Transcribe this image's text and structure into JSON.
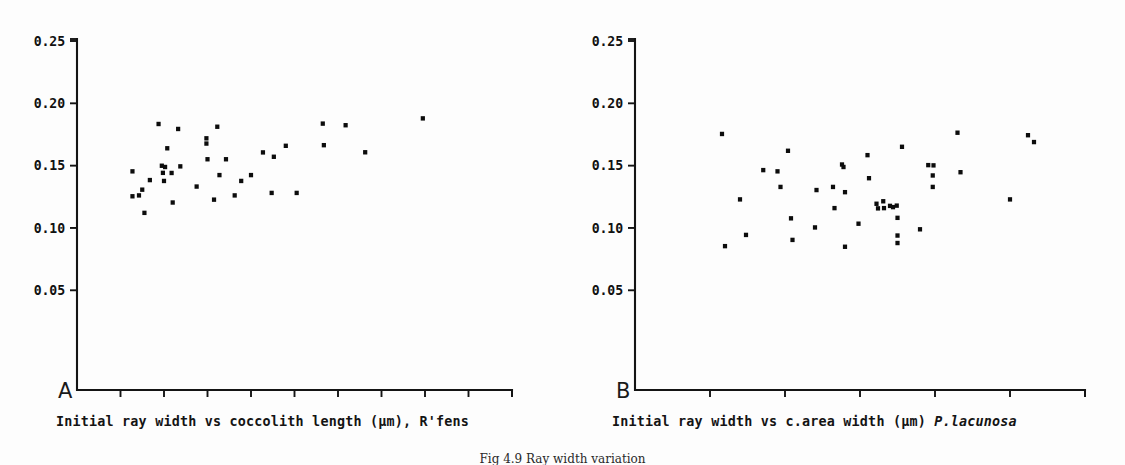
{
  "figure": {
    "caption": "Fig 4.9   Ray width variation",
    "background_color": "#fdfdfd",
    "ink_color": "#0c0c0c"
  },
  "panels": [
    {
      "id": "A",
      "letter": "A",
      "caption_prefix": "Initial ray width vs coccolith length (µm), R'fens",
      "caption_species": "",
      "species_italic": false
    },
    {
      "id": "B",
      "letter": "B",
      "caption_prefix": "Initial ray width vs c.area width (µm) ",
      "caption_species": "P.lacunosa",
      "species_italic": true
    }
  ],
  "chart_data": [
    {
      "type": "scatter",
      "panel": "A",
      "title": "",
      "xlabel": "Initial ray width vs coccolith length (µm), R'fens",
      "ylabel": "",
      "xlim": [
        0,
        20
      ],
      "ylim": [
        0,
        0.25
      ],
      "xticks": [
        2,
        4,
        6,
        8,
        10,
        12,
        14,
        16,
        18,
        20
      ],
      "xticklabels": [
        "2",
        "4",
        "6",
        "8",
        "10",
        "12",
        "14",
        "16",
        "18",
        "20"
      ],
      "yticks": [
        0.05,
        0.1,
        0.15,
        0.2,
        0.25
      ],
      "yticklabels": [
        "0.05",
        "0.10",
        "0.15",
        "0.20",
        "0.25"
      ],
      "grid": false,
      "legend": false,
      "marker": "square",
      "marker_color": "#0c0c0c",
      "points": [
        [
          2.55,
          0.1455
        ],
        [
          2.55,
          0.1255
        ],
        [
          2.85,
          0.1262
        ],
        [
          3.0,
          0.1308
        ],
        [
          3.1,
          0.1122
        ],
        [
          3.35,
          0.1385
        ],
        [
          3.75,
          0.1835
        ],
        [
          3.9,
          0.15
        ],
        [
          3.95,
          0.1443
        ],
        [
          4.05,
          0.149
        ],
        [
          4.0,
          0.1378
        ],
        [
          4.15,
          0.164
        ],
        [
          4.35,
          0.1442
        ],
        [
          4.4,
          0.1205
        ],
        [
          4.65,
          0.1795
        ],
        [
          4.75,
          0.1495
        ],
        [
          5.5,
          0.1333
        ],
        [
          5.95,
          0.172
        ],
        [
          5.95,
          0.1678
        ],
        [
          6.0,
          0.1552
        ],
        [
          6.3,
          0.1228
        ],
        [
          6.45,
          0.1813
        ],
        [
          6.55,
          0.1425
        ],
        [
          6.85,
          0.1552
        ],
        [
          7.25,
          0.1262
        ],
        [
          7.55,
          0.1378
        ],
        [
          8.0,
          0.1425
        ],
        [
          8.55,
          0.1607
        ],
        [
          8.95,
          0.1282
        ],
        [
          9.05,
          0.1572
        ],
        [
          9.6,
          0.166
        ],
        [
          10.1,
          0.1282
        ],
        [
          11.3,
          0.1838
        ],
        [
          11.35,
          0.1665
        ],
        [
          12.35,
          0.1825
        ],
        [
          13.25,
          0.1608
        ],
        [
          15.9,
          0.188
        ]
      ]
    },
    {
      "type": "scatter",
      "panel": "B",
      "title": "",
      "xlabel": "Initial ray width vs c.area width (µm) P.lacunosa",
      "ylabel": "",
      "xlim": [
        0,
        3.0
      ],
      "ylim": [
        0,
        0.25
      ],
      "xticks": [
        0.5,
        1.0,
        1.5,
        2.0,
        2.5,
        3.0
      ],
      "xticklabels": [
        "0.5",
        "1.0",
        "1.5",
        "2.0",
        "2.5",
        "3.0"
      ],
      "yticks": [
        0.05,
        0.1,
        0.15,
        0.2,
        0.25
      ],
      "yticklabels": [
        "0.05",
        "0.10",
        "0.15",
        "0.20",
        "0.25"
      ],
      "grid": false,
      "legend": false,
      "marker": "square",
      "marker_color": "#0c0c0c",
      "points": [
        [
          0.58,
          0.1755
        ],
        [
          0.6,
          0.0855
        ],
        [
          0.7,
          0.123
        ],
        [
          0.74,
          0.0945
        ],
        [
          0.855,
          0.1465
        ],
        [
          0.95,
          0.1455
        ],
        [
          0.97,
          0.133
        ],
        [
          1.02,
          0.162
        ],
        [
          1.04,
          0.1078
        ],
        [
          1.05,
          0.0905
        ],
        [
          1.2,
          0.1005
        ],
        [
          1.21,
          0.1305
        ],
        [
          1.32,
          0.133
        ],
        [
          1.33,
          0.116
        ],
        [
          1.38,
          0.151
        ],
        [
          1.39,
          0.149
        ],
        [
          1.4,
          0.1288
        ],
        [
          1.4,
          0.085
        ],
        [
          1.49,
          0.1035
        ],
        [
          1.55,
          0.1585
        ],
        [
          1.56,
          0.14
        ],
        [
          1.61,
          0.1195
        ],
        [
          1.62,
          0.1158
        ],
        [
          1.655,
          0.1215
        ],
        [
          1.66,
          0.116
        ],
        [
          1.7,
          0.1178
        ],
        [
          1.72,
          0.1168
        ],
        [
          1.745,
          0.118
        ],
        [
          1.75,
          0.1082
        ],
        [
          1.75,
          0.094
        ],
        [
          1.75,
          0.088
        ],
        [
          1.78,
          0.1652
        ],
        [
          1.9,
          0.099
        ],
        [
          1.955,
          0.1505
        ],
        [
          1.99,
          0.1503
        ],
        [
          1.985,
          0.1422
        ],
        [
          1.985,
          0.133
        ],
        [
          2.15,
          0.1765
        ],
        [
          2.17,
          0.1448
        ],
        [
          2.5,
          0.123
        ],
        [
          2.62,
          0.1745
        ],
        [
          2.66,
          0.169
        ]
      ]
    }
  ]
}
